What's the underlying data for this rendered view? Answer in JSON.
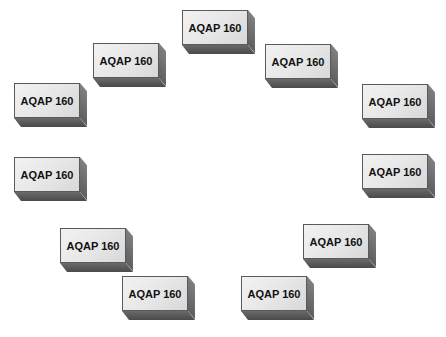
{
  "diagram": {
    "layout": "ring",
    "box_count": 11,
    "colors": {
      "front_face": "#e8e8e8",
      "side_face": "#707070",
      "bottom_face": "#555555",
      "border": "#5a5a5a",
      "text": "#111111",
      "background": "#ffffff"
    },
    "boxes": [
      {
        "label": "AQAP 160",
        "x": 182,
        "y": 10
      },
      {
        "label": "AQAP 160",
        "x": 93,
        "y": 43
      },
      {
        "label": "AQAP 160",
        "x": 265,
        "y": 44
      },
      {
        "label": "AQAP 160",
        "x": 14,
        "y": 83
      },
      {
        "label": "AQAP 160",
        "x": 362,
        "y": 84
      },
      {
        "label": "AQAP 160",
        "x": 14,
        "y": 157
      },
      {
        "label": "AQAP 160",
        "x": 362,
        "y": 154
      },
      {
        "label": "AQAP 160",
        "x": 60,
        "y": 228
      },
      {
        "label": "AQAP 160",
        "x": 303,
        "y": 224
      },
      {
        "label": "AQAP 160",
        "x": 122,
        "y": 276
      },
      {
        "label": "AQAP 160",
        "x": 241,
        "y": 276
      }
    ]
  }
}
